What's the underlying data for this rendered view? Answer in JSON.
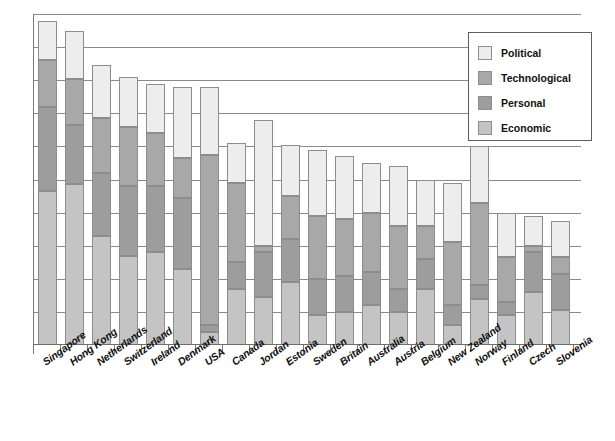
{
  "chart": {
    "type": "bar",
    "title": "",
    "subtitle": "",
    "xlabel": "",
    "ylabel": "",
    "orientation": "vertical-stacked",
    "grid": "horizontal",
    "legend_position": "top-right"
  },
  "legend": {
    "items": [
      {
        "label": "Political",
        "color": "#ededed"
      },
      {
        "label": "Technological",
        "color": "#a8a8a8"
      },
      {
        "label": "Personal",
        "color": "#9d9d9d"
      },
      {
        "label": "Economic",
        "color": "#c4c4c4"
      }
    ]
  },
  "chart_data": {
    "type": "bar",
    "stacked": true,
    "title": "",
    "xlabel": "",
    "ylabel": "",
    "ylim": [
      0,
      100
    ],
    "grid": true,
    "gridlines": [
      0,
      10,
      20,
      30,
      40,
      50,
      60,
      70,
      80,
      90,
      100
    ],
    "legend_position": "top-right",
    "categories": [
      "Singapore",
      "Hong Kong",
      "Netherlands",
      "Switzerland",
      "Ireland",
      "Denmark",
      "USA",
      "Canada",
      "Jordan",
      "Estonia",
      "Sweden",
      "Britain",
      "Australia",
      "Austria",
      "Belgium",
      "New Zealand",
      "Norway",
      "Finland",
      "Czech",
      "Slovenia"
    ],
    "series": [
      {
        "name": "Economic",
        "color": "#c4c4c4",
        "values": [
          46.5,
          48.5,
          33.0,
          27.0,
          28.0,
          23.0,
          4.0,
          17.0,
          14.5,
          19.0,
          9.0,
          10.0,
          12.0,
          10.0,
          17.0,
          6.0,
          14.0,
          9.0,
          16.0,
          10.5
        ]
      },
      {
        "name": "Personal",
        "color": "#9d9d9d",
        "values": [
          25.5,
          18.0,
          19.0,
          21.0,
          20.0,
          21.5,
          2.0,
          8.0,
          13.5,
          13.0,
          11.0,
          11.0,
          10.0,
          7.0,
          9.0,
          6.0,
          4.0,
          4.0,
          12.0,
          11.0
        ]
      },
      {
        "name": "Technological",
        "color": "#a8a8a8",
        "values": [
          14.0,
          14.0,
          16.5,
          18.0,
          16.0,
          12.0,
          51.5,
          24.0,
          2.0,
          13.0,
          19.0,
          17.0,
          18.0,
          19.0,
          10.0,
          19.0,
          25.0,
          13.5,
          2.0,
          5.0
        ]
      },
      {
        "name": "Political",
        "color": "#ededed",
        "values": [
          12.0,
          14.5,
          16.0,
          15.0,
          15.0,
          21.5,
          20.5,
          12.0,
          38.0,
          15.5,
          20.0,
          19.0,
          15.0,
          18.0,
          14.0,
          18.0,
          17.0,
          13.5,
          9.0,
          11.0
        ]
      }
    ],
    "totals": [
      98.0,
      95.0,
      84.5,
      81.0,
      79.0,
      78.0,
      78.0,
      61.0,
      68.0,
      60.5,
      59.0,
      57.0,
      55.0,
      54.0,
      50.0,
      49.0,
      60.0,
      40.0,
      39.0,
      37.5
    ]
  }
}
